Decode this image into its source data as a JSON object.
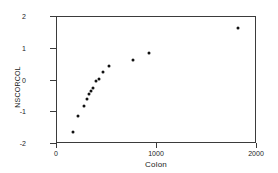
{
  "chart_data": {
    "type": "scatter",
    "title": "",
    "xlabel": "Colon",
    "ylabel": "NSCORCOL",
    "xlim": [
      0,
      2000
    ],
    "ylim": [
      -2,
      2
    ],
    "xticks": [
      0,
      1000,
      2000
    ],
    "xtick_labels": [
      "0",
      "1000",
      "2000"
    ],
    "yticks": [
      2,
      1,
      0,
      -1,
      -2
    ],
    "ytick_labels": [
      "2",
      "1",
      "0",
      "-1",
      "-2"
    ],
    "grid": false,
    "legend": null,
    "marker_color": "#111111",
    "frame_color": "#3b3b3b",
    "background_color": "#ffffff",
    "x": [
      165,
      215,
      275,
      310,
      330,
      350,
      370,
      400,
      430,
      470,
      530,
      770,
      930,
      1820
    ],
    "y": [
      -1.65,
      -1.15,
      -0.85,
      -0.62,
      -0.45,
      -0.35,
      -0.27,
      -0.05,
      0.02,
      0.25,
      0.42,
      0.6,
      0.85,
      1.62
    ],
    "points": [
      {
        "x": 165,
        "y": -1.65
      },
      {
        "x": 215,
        "y": -1.15
      },
      {
        "x": 275,
        "y": -0.85
      },
      {
        "x": 310,
        "y": -0.62
      },
      {
        "x": 330,
        "y": -0.45
      },
      {
        "x": 350,
        "y": -0.35
      },
      {
        "x": 370,
        "y": -0.27
      },
      {
        "x": 400,
        "y": -0.05
      },
      {
        "x": 430,
        "y": 0.02
      },
      {
        "x": 470,
        "y": 0.25
      },
      {
        "x": 530,
        "y": 0.42
      },
      {
        "x": 770,
        "y": 0.6
      },
      {
        "x": 930,
        "y": 0.85
      },
      {
        "x": 1820,
        "y": 1.62
      }
    ]
  }
}
